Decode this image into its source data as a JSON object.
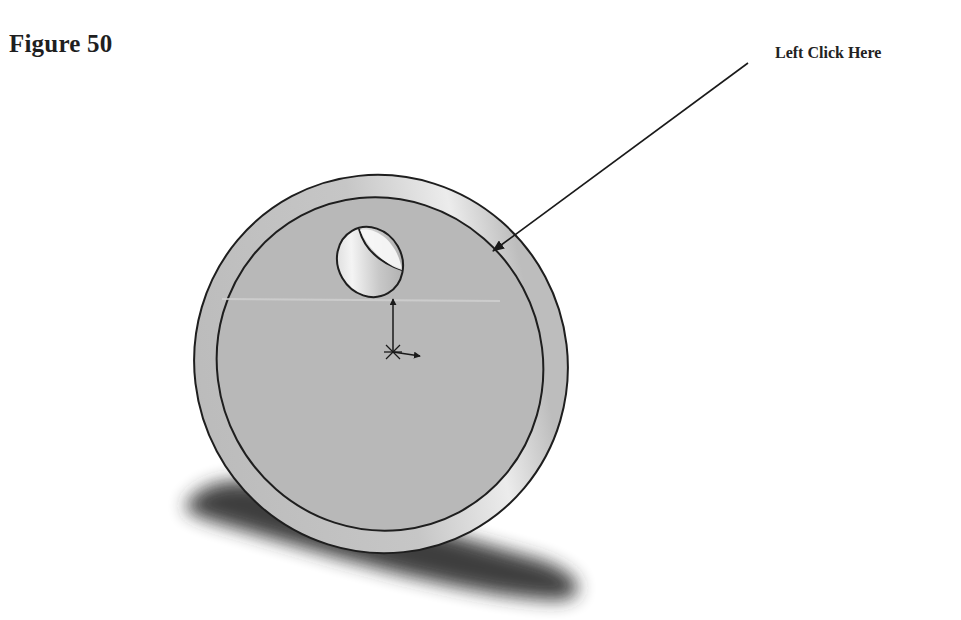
{
  "figure": {
    "title": "Figure 50",
    "callout": {
      "label": "Left Click Here",
      "target": "outer-cylindrical-edge-face"
    }
  },
  "model": {
    "part": "disc-with-hole",
    "features": [
      "outer-rim",
      "front-face",
      "through-hole",
      "origin-triad",
      "ground-shadow"
    ],
    "colors": {
      "face": "#b8b8b8",
      "rim": "#c4c4c4",
      "rim_highlight": "#ececec",
      "edge": "#1e1e1e",
      "shadow": "#2a2a2a",
      "background": "#ffffff"
    }
  },
  "icons": {
    "callout_arrow": "arrow-pointer",
    "origin": "coordinate-triad"
  }
}
